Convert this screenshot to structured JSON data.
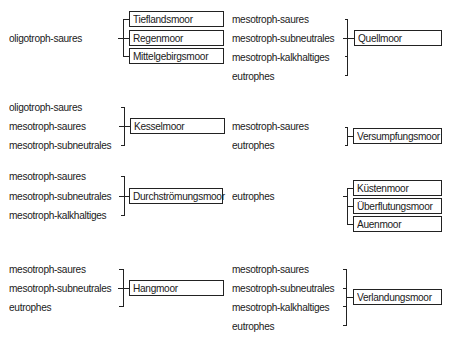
{
  "groups": [
    {
      "left": {
        "inputs": [
          "oligotroph-saures"
        ],
        "outputs": [
          "Tieflandsmoor",
          "Regenmoor",
          "Mittelgebirgsmoor"
        ]
      },
      "right": {
        "inputs": [
          "mesotroph-saures",
          "mesotroph-subneutrales",
          "mesotroph-kalkhaltiges",
          "eutrophes"
        ],
        "outputs": [
          "Quellmoor"
        ]
      }
    },
    {
      "left": {
        "inputs": [
          "oligotroph-saures",
          "mesotroph-saures",
          "mesotroph-subneutrales"
        ],
        "outputs": [
          "Kesselmoor"
        ]
      },
      "right": {
        "inputs": [
          "mesotroph-saures",
          "eutrophes"
        ],
        "outputs": [
          "Versumpfungsmoor"
        ]
      }
    },
    {
      "left": {
        "inputs": [
          "mesotroph-saures",
          "mesotroph-subneutrales",
          "mesotroph-kalkhaltiges"
        ],
        "outputs": [
          "Durchströmungsmoor"
        ]
      },
      "right": {
        "inputs": [
          "eutrophes"
        ],
        "outputs": [
          "Küstenmoor",
          "Überflutungsmoor",
          "Auenmoor"
        ]
      }
    },
    {
      "left": {
        "inputs": [
          "mesotroph-saures",
          "mesotroph-subneutrales",
          "eutrophes"
        ],
        "outputs": [
          "Hangmoor"
        ]
      },
      "right": {
        "inputs": [
          "mesotroph-saures",
          "mesotroph-subneutrales",
          "mesotroph-kalkhaltiges",
          "eutrophes"
        ],
        "outputs": [
          "Verlandungsmoor"
        ]
      }
    }
  ],
  "colors": {
    "line": "#222222",
    "text": "#1a1a1a",
    "background": "#ffffff"
  }
}
